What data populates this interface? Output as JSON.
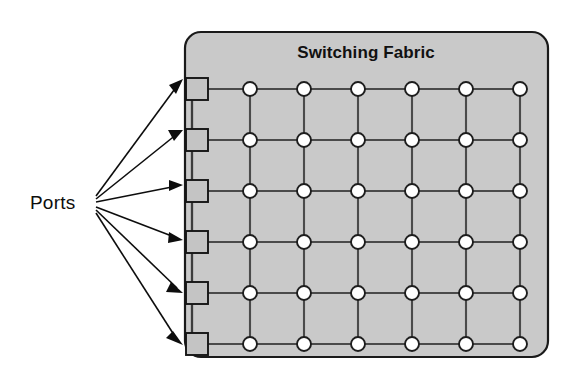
{
  "diagram": {
    "type": "crossbar-switch-fabric",
    "fabric": {
      "title": "Switching Fabric",
      "fill_color": "#c9c9c9",
      "border_color": "#1a1a1a",
      "corner_radius": 16,
      "x": 185,
      "y": 32,
      "width": 363,
      "height": 325
    },
    "ports_label": {
      "text": "Ports",
      "x": 30,
      "y": 209
    },
    "port_count": 6,
    "crosspoint_columns": 6,
    "crosspoint_rows": 6,
    "port_square": {
      "size": 22,
      "fill_color": "#c4c4c4",
      "border_color": "#151515",
      "center_x": 197
    },
    "crosspoint": {
      "radius": 7,
      "fill_color": "#ffffff",
      "border_color": "#1d1d1d"
    },
    "grid": {
      "line_color": "#4a4a4a",
      "column_x": [
        250,
        304,
        358,
        412,
        466,
        520
      ],
      "row_y": [
        89,
        140,
        191,
        242,
        293,
        344
      ]
    },
    "arrow_origin": {
      "x": 96,
      "y": 203
    },
    "arrow_color": "#0d0d0d",
    "arrow_count": 6,
    "background_color": "#ffffff"
  }
}
